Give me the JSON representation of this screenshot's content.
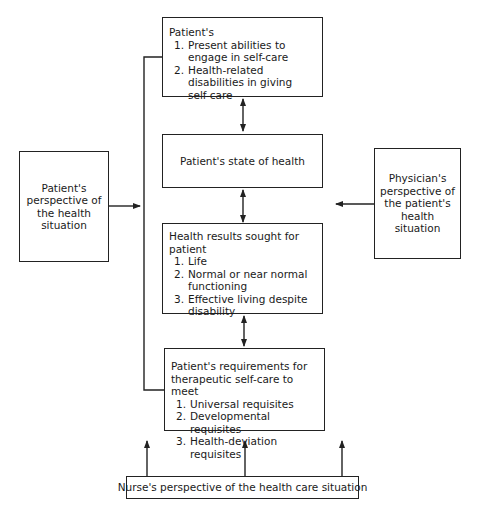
{
  "boxes": {
    "abilities": {
      "heading": "Patient's",
      "items": [
        {
          "num": "1.",
          "text": "Present abilities to engage in self-care"
        },
        {
          "num": "2.",
          "text": "Health-related disabilities in giving self-care"
        }
      ]
    },
    "state": {
      "text": "Patient's state of health"
    },
    "results": {
      "heading": "Health results sought for patient",
      "items": [
        {
          "num": "1.",
          "text": "Life"
        },
        {
          "num": "2.",
          "text": "Normal or near normal functioning"
        },
        {
          "num": "3.",
          "text": "Effective living despite disability"
        }
      ]
    },
    "requirements": {
      "heading": "Patient's requirements for therapeutic self-care to meet",
      "items": [
        {
          "num": "1.",
          "text": "Universal requisites"
        },
        {
          "num": "2.",
          "text": "Developmental requisites"
        },
        {
          "num": "3.",
          "text": "Health-deviation requisites"
        }
      ]
    },
    "patient_perspective": {
      "text": "Patient's perspective of the health situation"
    },
    "physician_perspective": {
      "text": "Physician's perspective of the patient's health situation"
    },
    "nurse_perspective": {
      "text": "Nurse's perspective of the health care situation"
    }
  }
}
